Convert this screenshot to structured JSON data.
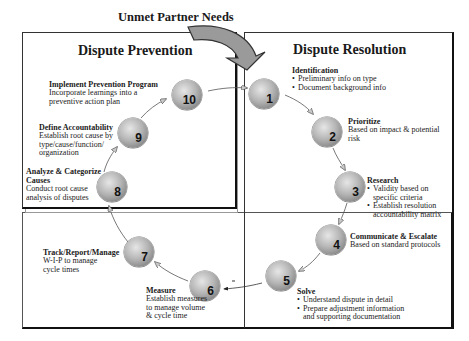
{
  "header": {
    "title": "Unmet Partner Needs"
  },
  "prevention": {
    "title": "Dispute Prevention",
    "steps": [
      {
        "number": "8",
        "title": "Analyze & Categorize Causes",
        "text": "Conduct root cause analysis of disputes"
      },
      {
        "number": "9",
        "title": "Define Accountability",
        "text": "Establish root cause by type/cause/function/ organization"
      },
      {
        "number": "10",
        "title": "Implement Prevention Program",
        "text": "Incorporate learnings into a preventive action plan"
      }
    ]
  },
  "resolution": {
    "title": "Dispute Resolution",
    "steps": [
      {
        "number": "1",
        "title": "Identification",
        "bullets": [
          "Preliminary info on type",
          "Document background info"
        ]
      },
      {
        "number": "2",
        "title": "Prioritize",
        "text": "Based on impact & potential risk"
      },
      {
        "number": "3",
        "title": "Research",
        "bullets": [
          "Validity based on specific criteria",
          "Establish resolution accountability matrix"
        ]
      },
      {
        "number": "4",
        "title": "Communicate & Escalate",
        "text": "Based on standard protocols"
      },
      {
        "number": "5",
        "title": "Solve",
        "bullets": [
          "Understand dispute in detail",
          "Prepare adjustment information and supporting documentation"
        ]
      }
    ]
  },
  "tracking": {
    "steps": [
      {
        "number": "6",
        "title": "Measure",
        "text": "Establish measures to manage volume & cycle time"
      },
      {
        "number": "7",
        "title": "Track/Report/Manage",
        "text": "W-I-P to manage cycle times"
      }
    ]
  },
  "colors": {
    "ball_light": "#e6e6e6",
    "ball_dark": "#6f6f6f",
    "border": "#111111",
    "arrow_fill": "#9a9a9a"
  }
}
